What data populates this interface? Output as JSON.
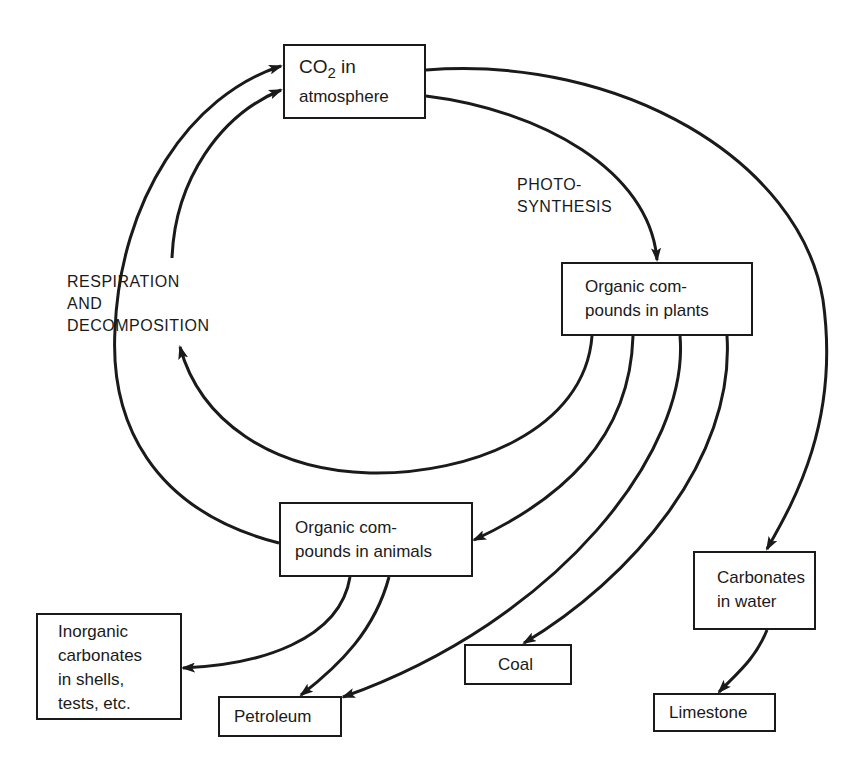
{
  "diagram": {
    "type": "carbon-cycle flow diagram",
    "nodes": {
      "co2": {
        "line1_a": "CO",
        "line1_sub": "2",
        "line1_b": " in",
        "line2": "atmosphere"
      },
      "plants": {
        "line1": "Organic com-",
        "line2": "pounds in plants"
      },
      "animals": {
        "line1": "Organic com-",
        "line2": "pounds in animals"
      },
      "inorganic": {
        "line1": "Inorganic",
        "line2": "carbonates",
        "line3": "in shells,",
        "line4": "tests, etc."
      },
      "petroleum": {
        "line1": "Petroleum"
      },
      "coal": {
        "line1": "Coal"
      },
      "carbonates_water": {
        "line1": "Carbonates",
        "line2": "in water"
      },
      "limestone": {
        "line1": "Limestone"
      }
    },
    "labels": {
      "photosynthesis": {
        "line1": "PHOTO-",
        "line2": "SYNTHESIS"
      },
      "respiration": {
        "line1": "RESPIRATION",
        "line2": "AND",
        "line3": "DECOMPOSITION"
      }
    },
    "edges": [
      {
        "from": "CO2 in atmosphere",
        "to": "Organic compounds in plants",
        "label": "PHOTO-SYNTHESIS"
      },
      {
        "from": "CO2 in atmosphere",
        "to": "Carbonates in water"
      },
      {
        "from": "Organic compounds in plants",
        "to": "CO2 in atmosphere",
        "label": "RESPIRATION AND DECOMPOSITION"
      },
      {
        "from": "Organic compounds in animals",
        "to": "CO2 in atmosphere",
        "label": "RESPIRATION AND DECOMPOSITION"
      },
      {
        "from": "Organic compounds in plants",
        "to": "Organic compounds in animals"
      },
      {
        "from": "Organic compounds in plants",
        "to": "Petroleum"
      },
      {
        "from": "Organic compounds in plants",
        "to": "Coal"
      },
      {
        "from": "Organic compounds in animals",
        "to": "Inorganic carbonates in shells, tests, etc."
      },
      {
        "from": "Organic compounds in animals",
        "to": "Petroleum"
      },
      {
        "from": "Carbonates in water",
        "to": "Limestone"
      }
    ],
    "colors": {
      "ink": "#1a1a1a",
      "background": "#ffffff"
    }
  }
}
